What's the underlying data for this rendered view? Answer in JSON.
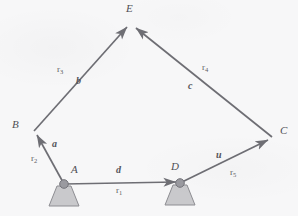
{
  "figure": {
    "type": "kinematic-linkage-diagram",
    "background_color": "#f7f7f8",
    "line_color": "#6e6e74",
    "support_fill": "#c9c9cc",
    "support_stroke": "#8d8d92",
    "pivot_fill": "#9a9aa0"
  },
  "nodes": [
    {
      "id": "A",
      "label": "A",
      "x": 64,
      "y": 184,
      "grounded": true,
      "label_x": 71,
      "label_y": 170
    },
    {
      "id": "B",
      "label": "B",
      "x": 34,
      "y": 131,
      "grounded": false,
      "label_x": 14,
      "label_y": 124
    },
    {
      "id": "C",
      "label": "C",
      "x": 272,
      "y": 137,
      "grounded": false,
      "label_x": 280,
      "label_y": 130
    },
    {
      "id": "D",
      "label": "D",
      "x": 180,
      "y": 183,
      "grounded": true,
      "label_x": 172,
      "label_y": 167
    },
    {
      "id": "E",
      "label": "E",
      "x": 130,
      "y": 22,
      "grounded": false,
      "label_x": 125,
      "label_y": 5
    }
  ],
  "links": [
    {
      "id": "link-a",
      "from": "A",
      "to": "B",
      "arrow_at": "B",
      "link_label": "a",
      "link_label_x": 53,
      "link_label_y": 144,
      "vector_label": "r",
      "vector_sub": "2",
      "vector_label_x": 32,
      "vector_label_y": 159
    },
    {
      "id": "link-b",
      "from": "B",
      "to": "E",
      "arrow_at": "E",
      "link_label": "b",
      "link_label_x": 77,
      "link_label_y": 81,
      "vector_label": "r",
      "vector_sub": "3",
      "vector_label_x": 58,
      "vector_label_y": 70
    },
    {
      "id": "link-c",
      "from": "C",
      "to": "E",
      "arrow_at": "E",
      "link_label": "c",
      "link_label_x": 188,
      "link_label_y": 85,
      "vector_label": "r",
      "vector_sub": "4",
      "vector_label_x": 203,
      "vector_label_y": 68
    },
    {
      "id": "link-d",
      "from": "A",
      "to": "D",
      "arrow_at": "D",
      "link_label": "d",
      "link_label_x": 117,
      "link_label_y": 170,
      "vector_label": "r",
      "vector_sub": "1",
      "vector_label_x": 117,
      "vector_label_y": 191
    },
    {
      "id": "link-u",
      "from": "D",
      "to": "C",
      "arrow_at": "C",
      "link_label": "u",
      "link_label_x": 217,
      "link_label_y": 155,
      "vector_label": "r",
      "vector_sub": "5",
      "vector_label_x": 231,
      "vector_label_y": 173
    }
  ]
}
